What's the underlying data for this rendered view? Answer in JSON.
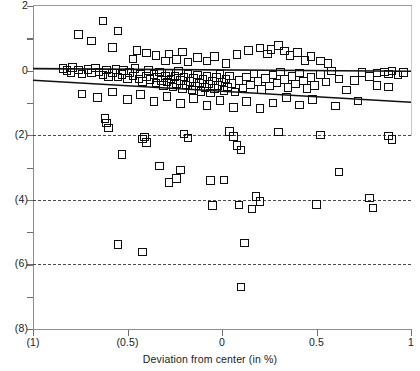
{
  "chart_data": {
    "type": "scatter",
    "title": "",
    "xlabel": "Deviation from center (in %)",
    "ylabel": "",
    "xlim": [
      -1,
      1
    ],
    "ylim": [
      -8,
      2
    ],
    "grid": "horizontal-dashed",
    "legend": "none",
    "x_ticks": [
      {
        "value": -1,
        "label": "(1)"
      },
      {
        "value": -0.5,
        "label": "(0.5)"
      },
      {
        "value": 0,
        "label": "0"
      },
      {
        "value": 0.5,
        "label": "0.5"
      },
      {
        "value": 1,
        "label": "1"
      }
    ],
    "y_ticks": [
      {
        "value": 2,
        "label": "2",
        "major": true,
        "grid": false
      },
      {
        "value": 1,
        "label": "",
        "major": false,
        "grid": false
      },
      {
        "value": 0,
        "label": "0",
        "major": true,
        "grid": false
      },
      {
        "value": -1,
        "label": "",
        "major": false,
        "grid": false
      },
      {
        "value": -2,
        "label": "(2)",
        "major": true,
        "grid": true
      },
      {
        "value": -3,
        "label": "",
        "major": false,
        "grid": false
      },
      {
        "value": -4,
        "label": "(4)",
        "major": true,
        "grid": true
      },
      {
        "value": -5,
        "label": "",
        "major": false,
        "grid": false
      },
      {
        "value": -6,
        "label": "(6)",
        "major": true,
        "grid": true
      },
      {
        "value": -7,
        "label": "",
        "major": false,
        "grid": false
      },
      {
        "value": -8,
        "label": "(8)",
        "major": true,
        "grid": false
      }
    ],
    "marker_style": "open-square",
    "marker_color": "#0d0d0d",
    "trend_lines": [
      {
        "name": "upper-regression-line",
        "x0": -1.0,
        "y0": 0.06,
        "x1": 1.0,
        "y1": -0.02,
        "color": "#111111"
      },
      {
        "name": "lower-regression-line",
        "x0": -1.0,
        "y0": -0.3,
        "x1": 1.0,
        "y1": -0.98,
        "color": "#111111"
      }
    ],
    "points": [
      [
        -0.63,
        1.53
      ],
      [
        -0.76,
        1.12
      ],
      [
        -0.55,
        1.22
      ],
      [
        -0.69,
        0.92
      ],
      [
        -0.58,
        0.72
      ],
      [
        -0.45,
        0.62
      ],
      [
        -0.4,
        0.54
      ],
      [
        -0.47,
        0.36
      ],
      [
        -0.35,
        0.46
      ],
      [
        -0.3,
        0.3
      ],
      [
        -0.28,
        0.52
      ],
      [
        -0.24,
        0.34
      ],
      [
        -0.21,
        0.58
      ],
      [
        -0.18,
        0.26
      ],
      [
        -0.13,
        0.4
      ],
      [
        -0.08,
        0.3
      ],
      [
        -0.04,
        0.44
      ],
      [
        0.02,
        0.22
      ],
      [
        0.08,
        0.5
      ],
      [
        0.14,
        0.62
      ],
      [
        0.2,
        0.7
      ],
      [
        0.24,
        0.52
      ],
      [
        0.26,
        0.66
      ],
      [
        0.3,
        0.78
      ],
      [
        0.33,
        0.6
      ],
      [
        0.36,
        0.46
      ],
      [
        0.4,
        0.56
      ],
      [
        0.44,
        0.32
      ],
      [
        0.47,
        0.44
      ],
      [
        0.52,
        0.3
      ],
      [
        0.56,
        0.22
      ],
      [
        -0.84,
        0.06
      ],
      [
        -0.82,
        0.0
      ],
      [
        -0.8,
        -0.06
      ],
      [
        -0.79,
        0.1
      ],
      [
        -0.76,
        0.02
      ],
      [
        -0.74,
        -0.1
      ],
      [
        -0.71,
        0.04
      ],
      [
        -0.69,
        -0.08
      ],
      [
        -0.67,
        0.08
      ],
      [
        -0.65,
        -0.04
      ],
      [
        -0.63,
        -0.14
      ],
      [
        -0.61,
        0.02
      ],
      [
        -0.6,
        -0.18
      ],
      [
        -0.58,
        -0.08
      ],
      [
        -0.56,
        0.04
      ],
      [
        -0.55,
        -0.2
      ],
      [
        -0.53,
        -0.12
      ],
      [
        -0.52,
        0.0
      ],
      [
        -0.5,
        -0.24
      ],
      [
        -0.49,
        -0.06
      ],
      [
        -0.47,
        -0.16
      ],
      [
        -0.46,
        0.06
      ],
      [
        -0.44,
        -0.26
      ],
      [
        -0.43,
        -0.1
      ],
      [
        -0.42,
        -0.34
      ],
      [
        -0.4,
        -0.18
      ],
      [
        -0.39,
        0.0
      ],
      [
        -0.38,
        -0.28
      ],
      [
        -0.36,
        -0.12
      ],
      [
        -0.35,
        -0.38
      ],
      [
        -0.34,
        -0.22
      ],
      [
        -0.33,
        -0.04
      ],
      [
        -0.32,
        -0.3
      ],
      [
        -0.31,
        -0.46
      ],
      [
        -0.3,
        -0.16
      ],
      [
        -0.29,
        -0.36
      ],
      [
        -0.28,
        -0.08
      ],
      [
        -0.27,
        -0.26
      ],
      [
        -0.26,
        -0.5
      ],
      [
        -0.25,
        -0.18
      ],
      [
        -0.24,
        -0.4
      ],
      [
        -0.23,
        -0.02
      ],
      [
        -0.22,
        -0.3
      ],
      [
        -0.21,
        -0.56
      ],
      [
        -0.2,
        -0.2
      ],
      [
        -0.19,
        -0.44
      ],
      [
        -0.18,
        -0.1
      ],
      [
        -0.17,
        -0.34
      ],
      [
        -0.16,
        -0.6
      ],
      [
        -0.15,
        -0.24
      ],
      [
        -0.14,
        -0.48
      ],
      [
        -0.13,
        -0.14
      ],
      [
        -0.12,
        -0.38
      ],
      [
        -0.11,
        -0.64
      ],
      [
        -0.1,
        -0.28
      ],
      [
        -0.09,
        -0.52
      ],
      [
        -0.08,
        -0.18
      ],
      [
        -0.07,
        -0.42
      ],
      [
        -0.06,
        -0.7
      ],
      [
        -0.05,
        -0.32
      ],
      [
        -0.04,
        -0.56
      ],
      [
        -0.03,
        -0.22
      ],
      [
        -0.02,
        -0.46
      ],
      [
        -0.01,
        -0.12
      ],
      [
        0.0,
        -0.36
      ],
      [
        0.01,
        -0.62
      ],
      [
        0.02,
        -0.26
      ],
      [
        0.03,
        -0.5
      ],
      [
        0.04,
        -0.16
      ],
      [
        0.05,
        -0.4
      ],
      [
        0.07,
        -0.66
      ],
      [
        0.09,
        -0.3
      ],
      [
        0.11,
        -0.54
      ],
      [
        0.13,
        -0.2
      ],
      [
        0.15,
        -0.44
      ],
      [
        0.17,
        -0.1
      ],
      [
        0.19,
        -0.34
      ],
      [
        0.21,
        -0.58
      ],
      [
        0.23,
        -0.24
      ],
      [
        0.25,
        -0.48
      ],
      [
        0.27,
        -0.14
      ],
      [
        0.29,
        -0.38
      ],
      [
        0.31,
        -0.04
      ],
      [
        0.33,
        -0.28
      ],
      [
        0.35,
        -0.52
      ],
      [
        0.37,
        -0.18
      ],
      [
        0.39,
        -0.42
      ],
      [
        0.41,
        -0.08
      ],
      [
        0.43,
        -0.32
      ],
      [
        0.45,
        -0.56
      ],
      [
        0.47,
        -0.22
      ],
      [
        0.49,
        -0.46
      ],
      [
        0.52,
        -0.12
      ],
      [
        0.55,
        -0.36
      ],
      [
        0.58,
        -0.02
      ],
      [
        0.62,
        -0.26
      ],
      [
        0.66,
        -0.6
      ],
      [
        0.7,
        -0.3
      ],
      [
        0.74,
        -0.06
      ],
      [
        0.78,
        -0.18
      ],
      [
        0.82,
        -0.08
      ],
      [
        0.86,
        -0.04
      ],
      [
        0.88,
        -0.1
      ],
      [
        0.9,
        -0.02
      ],
      [
        0.93,
        -0.14
      ],
      [
        0.96,
        -0.06
      ],
      [
        0.82,
        -0.46
      ],
      [
        0.88,
        -0.5
      ],
      [
        -0.74,
        -0.72
      ],
      [
        -0.66,
        -0.84
      ],
      [
        -0.58,
        -0.66
      ],
      [
        -0.5,
        -0.9
      ],
      [
        -0.43,
        -0.74
      ],
      [
        -0.36,
        -0.96
      ],
      [
        -0.29,
        -0.8
      ],
      [
        -0.22,
        -1.02
      ],
      [
        -0.15,
        -0.86
      ],
      [
        -0.08,
        -1.08
      ],
      [
        -0.01,
        -0.92
      ],
      [
        0.06,
        -1.14
      ],
      [
        0.13,
        -0.96
      ],
      [
        0.2,
        -1.18
      ],
      [
        0.27,
        -1.0
      ],
      [
        0.34,
        -0.84
      ],
      [
        0.41,
        -1.06
      ],
      [
        0.48,
        -0.9
      ],
      [
        0.6,
        -1.1
      ],
      [
        0.72,
        -0.94
      ],
      [
        -0.62,
        -1.48
      ],
      [
        -0.61,
        -1.62
      ],
      [
        -0.6,
        -1.78
      ],
      [
        -0.42,
        -2.12
      ],
      [
        -0.4,
        -2.22
      ],
      [
        -0.41,
        -2.05
      ],
      [
        -0.2,
        -1.96
      ],
      [
        -0.18,
        -2.08
      ],
      [
        0.04,
        -1.88
      ],
      [
        0.06,
        -2.04
      ],
      [
        0.08,
        -2.32
      ],
      [
        0.1,
        -2.46
      ],
      [
        0.3,
        -1.9
      ],
      [
        0.52,
        -2.0
      ],
      [
        0.88,
        -2.02
      ],
      [
        0.9,
        -2.14
      ],
      [
        -0.53,
        -2.6
      ],
      [
        -0.33,
        -2.96
      ],
      [
        -0.22,
        -3.08
      ],
      [
        -0.24,
        -3.34
      ],
      [
        -0.28,
        -3.46
      ],
      [
        -0.06,
        -3.4
      ],
      [
        0.01,
        -3.38
      ],
      [
        0.62,
        -3.14
      ],
      [
        -0.05,
        -4.18
      ],
      [
        0.09,
        -4.16
      ],
      [
        0.18,
        -3.9
      ],
      [
        0.2,
        -4.06
      ],
      [
        0.16,
        -4.28
      ],
      [
        0.5,
        -4.14
      ],
      [
        0.78,
        -3.94
      ],
      [
        0.8,
        -4.26
      ],
      [
        -0.55,
        -5.38
      ],
      [
        -0.42,
        -5.62
      ],
      [
        0.12,
        -5.34
      ],
      [
        0.1,
        -6.7
      ]
    ]
  }
}
